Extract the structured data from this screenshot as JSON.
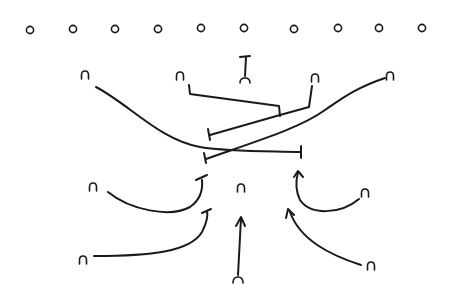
{
  "diagram": {
    "type": "football-play",
    "ink_color": "#1a1a1a",
    "background": "#ffffff",
    "offense": {
      "symbol": "circle",
      "players": [
        {
          "x": 30,
          "y": 30
        },
        {
          "x": 73,
          "y": 29
        },
        {
          "x": 115,
          "y": 29
        },
        {
          "x": 158,
          "y": 29
        },
        {
          "x": 201,
          "y": 28
        },
        {
          "x": 244,
          "y": 28
        },
        {
          "x": 294,
          "y": 29
        },
        {
          "x": 338,
          "y": 28
        },
        {
          "x": 379,
          "y": 28
        },
        {
          "x": 422,
          "y": 28
        }
      ]
    },
    "defense": {
      "symbol": "arch",
      "players": [
        {
          "id": "lb-far-left",
          "x": 85,
          "y": 75
        },
        {
          "id": "lb-left",
          "x": 180,
          "y": 76
        },
        {
          "id": "center-deep",
          "x": 245,
          "y": 77
        },
        {
          "id": "lb-right",
          "x": 315,
          "y": 78
        },
        {
          "id": "lb-far-right",
          "x": 390,
          "y": 76
        },
        {
          "id": "db-left",
          "x": 93,
          "y": 187
        },
        {
          "id": "middle",
          "x": 241,
          "y": 188
        },
        {
          "id": "db-right",
          "x": 365,
          "y": 193
        },
        {
          "id": "corner-left",
          "x": 83,
          "y": 260
        },
        {
          "id": "safety-bottom",
          "x": 238,
          "y": 281
        },
        {
          "id": "corner-right",
          "x": 371,
          "y": 266
        }
      ]
    },
    "routes": [
      {
        "from": "lb-far-left",
        "end": "block-bar",
        "path": "M96 87 C 140 110, 160 150, 230 150 L 300 152"
      },
      {
        "from": "lb-far-right",
        "end": "block-bar",
        "path": "M385 79 C 340 95, 320 120, 280 133 C 250 143, 225 150, 205 159"
      },
      {
        "from": "lb-left",
        "end": "junction",
        "path": "M188 86 L 190 94 L 280 107 L 280 115"
      },
      {
        "from": "lb-right",
        "end": "block-bar",
        "path": "M313 85 L 310 107 L 280 115 L 210 134"
      },
      {
        "from": "center-deep",
        "end": "block-bar",
        "path": "M245 58 L 245 77"
      },
      {
        "from": "db-left",
        "end": "block-bar",
        "path": "M108 192 C 130 210, 180 222, 200 195 L 205 178"
      },
      {
        "from": "corner-left",
        "end": "block-bar",
        "path": "M93 256 C 150 255, 205 255, 207 212"
      },
      {
        "from": "safety-bottom",
        "end": "arrow",
        "path": "M238 276 L 241 218"
      },
      {
        "from": "db-right",
        "end": "arrow",
        "path": "M359 199 C 330 218, 295 215, 296 172"
      },
      {
        "from": "corner-right",
        "end": "arrow",
        "path": "M361 265 C 320 255, 295 245, 289 209"
      }
    ]
  }
}
